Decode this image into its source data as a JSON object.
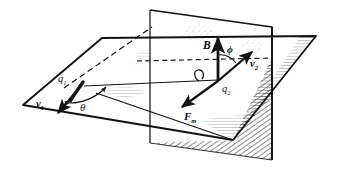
{
  "figure": {
    "type": "physics-vector-diagram",
    "background_color": "#ffffff",
    "ink_color": "#121212",
    "hatch_color": "#2b2b2b",
    "labels": {
      "charge1": {
        "base": "q",
        "sub": "1",
        "name": "q1"
      },
      "velocity1": {
        "base": "v",
        "sub": "1",
        "name": "v1"
      },
      "angle_theta": {
        "base": "θ",
        "sub": "",
        "name": "theta"
      },
      "charge2": {
        "base": "q",
        "sub": "2",
        "name": "q2"
      },
      "velocity2": {
        "base": "v",
        "sub": "2",
        "name": "v2"
      },
      "magnetic_field": {
        "base": "B",
        "sub": "",
        "name": "B"
      },
      "angle_phi": {
        "base": "ϕ",
        "sub": "",
        "name": "phi"
      },
      "magnetic_force": {
        "base": "F",
        "sub": "m",
        "name": "Fm"
      }
    },
    "geometry": {
      "horizontal_plane": {
        "name": "horizontal-plane",
        "points": "102,38 316,36 233,140 23,105",
        "note": "large flat quadrilateral in perspective"
      },
      "vertical_plane": {
        "name": "vertical-plane",
        "points": "150,10 272,27 272,160 150,143",
        "note": "upright plane intersecting the horizontal plane"
      },
      "hidden_edge_dashed": {
        "name": "hidden-edge",
        "from": "150,60",
        "to": "272,58"
      },
      "dashed_diagonal": {
        "name": "dashed-diagonal",
        "from": "66,86",
        "to": "152,27"
      },
      "origin_q2": {
        "x": 218,
        "y": 80
      },
      "origin_q1": {
        "x": 73,
        "y": 100
      }
    },
    "vectors": [
      {
        "name": "v1",
        "from": "80,88",
        "to": "58,112",
        "style": "thick-arrow"
      },
      {
        "name": "B",
        "from": "218,80",
        "to": "218,38",
        "style": "thick-arrow"
      },
      {
        "name": "v2",
        "from": "218,80",
        "to": "252,52",
        "style": "thick-arrow"
      },
      {
        "name": "Fm",
        "from": "218,80",
        "to": "182,106",
        "style": "thick-arrow"
      }
    ]
  }
}
